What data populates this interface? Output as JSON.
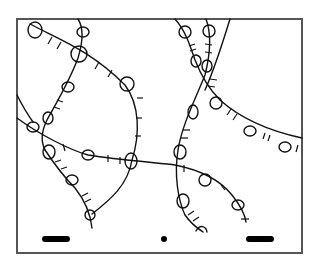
{
  "figure": {
    "frame": {
      "x": 17,
      "y": 19,
      "width": 285,
      "height": 234,
      "stroke": "#555555"
    },
    "ink_color": "#111111",
    "background": "#ffffff",
    "markers": [
      {
        "name": "left-bar",
        "x": 42,
        "y": 236,
        "width": 28,
        "height": 6
      },
      {
        "name": "center-dot",
        "x": 164,
        "y": 239,
        "r": 3
      },
      {
        "name": "right-bar",
        "x": 246,
        "y": 236,
        "width": 28,
        "height": 6
      }
    ],
    "strand_count": 8
  }
}
